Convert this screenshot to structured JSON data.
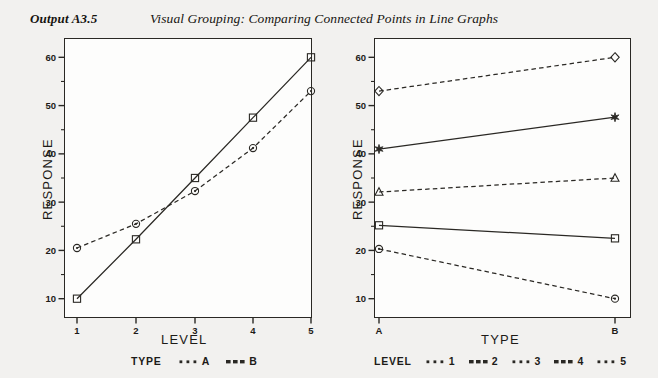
{
  "header": {
    "output_label": "Output A3.5",
    "title": "Visual Grouping: Comparing Connected Points in Line Graphs"
  },
  "chart_data": [
    {
      "id": "left",
      "type": "line",
      "title": "",
      "xlabel": "LEVEL",
      "ylabel": "RESPONSE",
      "x": [
        1,
        2,
        3,
        4,
        5
      ],
      "categories": [
        "1",
        "2",
        "3",
        "4",
        "5"
      ],
      "xlim": [
        0.6,
        5.4
      ],
      "ylim": [
        6,
        64
      ],
      "yticks": [
        10,
        20,
        30,
        40,
        50,
        60
      ],
      "yminor": [
        15,
        25,
        35,
        45,
        55
      ],
      "grid": false,
      "legend_title": "TYPE",
      "legend_position": "bottom",
      "series": [
        {
          "name": "A",
          "marker": "circle",
          "line": "dashed",
          "values": [
            20.5,
            25.5,
            32.3,
            41.2,
            53.0
          ]
        },
        {
          "name": "B",
          "marker": "square",
          "line": "solid",
          "values": [
            10.0,
            22.3,
            35.0,
            47.5,
            60.0
          ]
        }
      ]
    },
    {
      "id": "right",
      "type": "line",
      "title": "",
      "xlabel": "TYPE",
      "ylabel": "RESPONSE",
      "x": [
        "A",
        "B"
      ],
      "categories": [
        "A",
        "B"
      ],
      "ylim": [
        6,
        64
      ],
      "yticks": [
        10,
        20,
        30,
        40,
        50,
        60
      ],
      "yminor": [
        15,
        25,
        35,
        45,
        55
      ],
      "grid": false,
      "legend_title": "LEVEL",
      "legend_position": "bottom",
      "series": [
        {
          "name": "1",
          "marker": "circle",
          "line": "dashed",
          "values": [
            20.3,
            10.0
          ]
        },
        {
          "name": "2",
          "marker": "square",
          "line": "solid",
          "values": [
            25.2,
            22.5
          ]
        },
        {
          "name": "3",
          "marker": "triangle",
          "line": "dashed",
          "values": [
            32.1,
            35.0
          ]
        },
        {
          "name": "4",
          "marker": "star",
          "line": "solid",
          "values": [
            41.0,
            47.6
          ]
        },
        {
          "name": "5",
          "marker": "diamond",
          "line": "dashed",
          "values": [
            53.0,
            60.0
          ]
        }
      ]
    }
  ]
}
